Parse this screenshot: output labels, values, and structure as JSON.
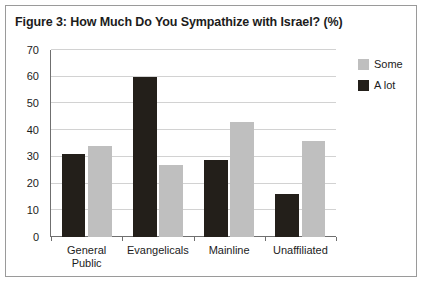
{
  "figure": {
    "title": "Figure 3: How Much Do You Sympathize with Israel? (%)",
    "border_color": "#9a9a9a",
    "background": "#ffffff"
  },
  "legend": {
    "position": "right",
    "entries": [
      {
        "label": "Some",
        "color": "#bfbfbf"
      },
      {
        "label": "A lot",
        "color": "#231f1a"
      }
    ]
  },
  "chart_data": {
    "type": "bar",
    "title": "Figure 3: How Much Do You Sympathize with Israel? (%)",
    "xlabel": "",
    "ylabel": "",
    "ylim": [
      0,
      70
    ],
    "ytick_step": 10,
    "yticks": [
      0,
      10,
      20,
      30,
      40,
      50,
      60,
      70
    ],
    "ytick_labels": [
      "0",
      "10",
      "20",
      "30",
      "40",
      "50",
      "60",
      "70"
    ],
    "grid": true,
    "grid_axis": "y",
    "legend_position": "right",
    "categories": [
      "General\nPublic",
      "Evangelicals",
      "Mainline",
      "Unaffiliated"
    ],
    "series": [
      {
        "name": "A lot",
        "color": "#231f1a",
        "values": [
          31,
          60,
          29,
          16
        ]
      },
      {
        "name": "Some",
        "color": "#bfbfbf",
        "values": [
          34,
          27,
          43,
          36
        ]
      }
    ]
  }
}
